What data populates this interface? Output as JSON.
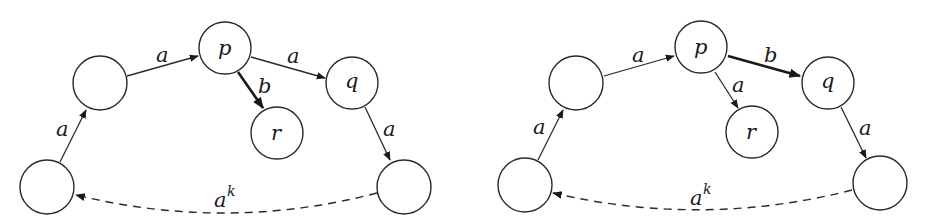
{
  "diagrams": [
    {
      "id": "left",
      "nodes": {
        "bottom_left": {
          "label": ""
        },
        "left_upper": {
          "label": ""
        },
        "p": {
          "label": "p"
        },
        "r": {
          "label": "r"
        },
        "q": {
          "label": "q"
        },
        "bottom_right": {
          "label": ""
        }
      },
      "edges": {
        "bl_to_lu": {
          "label": "a",
          "style": "normal"
        },
        "lu_to_p": {
          "label": "a",
          "style": "normal"
        },
        "p_to_q": {
          "label": "a",
          "style": "normal"
        },
        "p_to_r": {
          "label": "b",
          "style": "bold"
        },
        "q_to_br": {
          "label": "a",
          "style": "normal"
        },
        "br_to_bl": {
          "label": "a",
          "sup": "k",
          "style": "dashed"
        }
      }
    },
    {
      "id": "right",
      "nodes": {
        "bottom_left": {
          "label": ""
        },
        "left_upper": {
          "label": ""
        },
        "p": {
          "label": "p"
        },
        "r": {
          "label": "r"
        },
        "q": {
          "label": "q"
        },
        "bottom_right": {
          "label": ""
        }
      },
      "edges": {
        "bl_to_lu": {
          "label": "a",
          "style": "normal"
        },
        "lu_to_p": {
          "label": "a",
          "style": "normal"
        },
        "p_to_q": {
          "label": "b",
          "style": "bold"
        },
        "p_to_r": {
          "label": "a",
          "style": "normal"
        },
        "q_to_br": {
          "label": "a",
          "style": "normal"
        },
        "br_to_bl": {
          "label": "a",
          "sup": "k",
          "style": "dashed"
        }
      }
    }
  ]
}
